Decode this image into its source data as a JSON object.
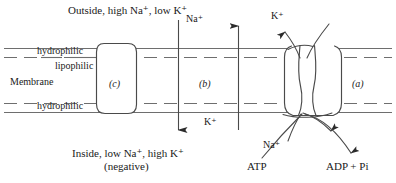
{
  "figure": {
    "type": "biological-diagram",
    "width": 396,
    "height": 183,
    "background": "#ffffff",
    "stroke_color": "#3a3a3a"
  },
  "labels": {
    "outside": "Outside, high Na⁺, low K⁺",
    "inside": "Inside, low Na⁺, high K⁺",
    "negative": "(negative)",
    "hydrophilic_top": "hydrophilic",
    "lipophilic": "lipophilic",
    "membrane": "Membrane",
    "hydrophilic_bottom": "hydrophilic",
    "na_top": "Na⁺",
    "k_bottom": "K⁺",
    "k_top": "K⁺",
    "na_pump": "Na⁺",
    "atp": "ATP",
    "adp_pi": "ADP + Pi"
  },
  "channels": [
    {
      "id": "a",
      "label": "(a)",
      "name": "sodium-potassium-pump",
      "x": 358,
      "y": 84
    },
    {
      "id": "b",
      "label": "(b)",
      "name": "passive-diffusion-zone",
      "x": 205,
      "y": 84
    },
    {
      "id": "c",
      "label": "(c)",
      "name": "membrane-protein-c",
      "x": 115,
      "y": 84
    }
  ],
  "membrane": {
    "solid_top_y": 48,
    "dashed_top_y": 57,
    "dashed_bottom_y": 103,
    "solid_bottom_y": 112,
    "left_x": 4,
    "right_x": 392
  },
  "arrows": [
    {
      "name": "na-influx-arrow",
      "direction": "down",
      "x": 178,
      "from_y": 18,
      "to_y": 131,
      "ion": "Na⁺"
    },
    {
      "name": "k-efflux-arrow",
      "direction": "up",
      "x": 238,
      "from_y": 131,
      "to_y": 24,
      "ion": "K⁺"
    },
    {
      "name": "na-extrusion-arrow",
      "direction": "up-left",
      "ion": "Na⁺"
    },
    {
      "name": "k-uptake-arrow",
      "direction": "down-left",
      "ion": "K⁺"
    },
    {
      "name": "atp-hydrolysis-arrow",
      "direction": "up-right",
      "ion": "ATP"
    },
    {
      "name": "adp-release-arrow",
      "direction": "down-right",
      "ion": "ADP + Pi"
    }
  ]
}
